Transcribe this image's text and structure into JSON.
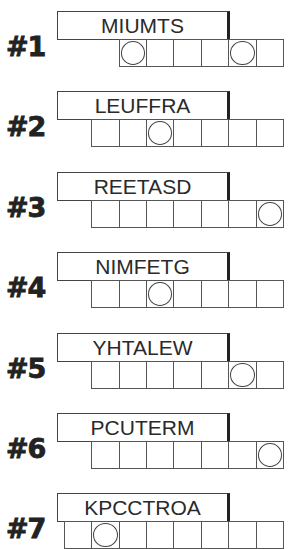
{
  "puzzles": [
    {
      "number": "#1",
      "scrambled": "MIUMTS",
      "length": 6,
      "circled": [
        1,
        5
      ]
    },
    {
      "number": "#2",
      "scrambled": "LEUFFRA",
      "length": 7,
      "circled": [
        3
      ]
    },
    {
      "number": "#3",
      "scrambled": "REETASD",
      "length": 7,
      "circled": [
        7
      ]
    },
    {
      "number": "#4",
      "scrambled": "NIMFETG",
      "length": 7,
      "circled": [
        3
      ]
    },
    {
      "number": "#5",
      "scrambled": "YHTALEW",
      "length": 7,
      "circled": [
        6
      ]
    },
    {
      "number": "#6",
      "scrambled": "PCUTERM",
      "length": 7,
      "circled": [
        7
      ]
    },
    {
      "number": "#7",
      "scrambled": "KPCCTROA",
      "length": 8,
      "circled": [
        2
      ]
    }
  ],
  "colors": {
    "line": "#555555",
    "text": "#2a2a2a",
    "background": "#ffffff"
  }
}
